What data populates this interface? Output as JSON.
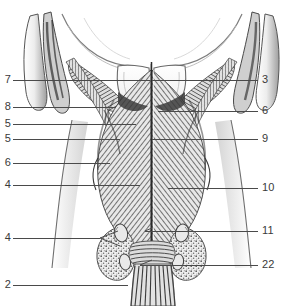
{
  "figure": {
    "domain": "anatomical-illustration",
    "style": "grayscale engraving / stipple and line hatching",
    "background_color": "#ffffff",
    "ink_color": "#3a3a3a",
    "leader_color": "#4a4a4a",
    "width": 303,
    "height": 306
  },
  "labels": {
    "left": [
      {
        "id": "left-1",
        "text": "7",
        "y": 80,
        "line_x1": 13,
        "line_x2": 150
      },
      {
        "id": "left-2",
        "text": "8",
        "y": 107,
        "line_x1": 13,
        "line_x2": 116
      },
      {
        "id": "left-3",
        "text": "5",
        "y": 124,
        "line_x1": 13,
        "line_x2": 136
      },
      {
        "id": "left-4",
        "text": "5",
        "y": 139,
        "line_x1": 13,
        "line_x2": 120
      },
      {
        "id": "left-5",
        "text": "6",
        "y": 163,
        "line_x1": 13,
        "line_x2": 110
      },
      {
        "id": "left-6",
        "text": "4",
        "y": 185,
        "line_x1": 13,
        "line_x2": 140
      },
      {
        "id": "left-7",
        "text": "4",
        "y": 238,
        "line_x1": 13,
        "line_x2": 100
      },
      {
        "id": "left-8",
        "text": "2",
        "y": 285,
        "line_x1": 13,
        "line_x2": 128
      }
    ],
    "right": [
      {
        "id": "right-1",
        "text": "3",
        "y": 80,
        "line_x1": 152,
        "line_x2": 258
      },
      {
        "id": "right-2",
        "text": "6",
        "y": 111,
        "line_x1": 158,
        "line_x2": 258
      },
      {
        "id": "right-3",
        "text": "9",
        "y": 139,
        "line_x1": 152,
        "line_x2": 258
      },
      {
        "id": "right-4",
        "text": "10",
        "y": 188,
        "line_x1": 168,
        "line_x2": 258
      },
      {
        "id": "right-5",
        "text": "11",
        "y": 231,
        "line_x1": 145,
        "line_x2": 258
      },
      {
        "id": "right-6",
        "text": "22",
        "y": 265,
        "line_x1": 140,
        "line_x2": 258
      }
    ]
  }
}
